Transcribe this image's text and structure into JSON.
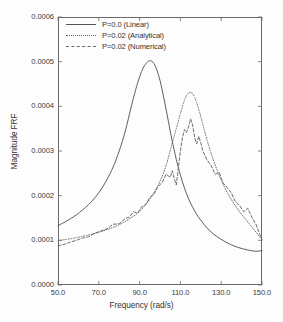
{
  "figure": {
    "background": "#fdfdfd",
    "frame_color": "#6a6a6a"
  },
  "axes": {
    "x_title": "Frequency (rad/s)",
    "y_title": "Magnitude FRF",
    "x_ticks": [
      "50.0",
      "70.0",
      "90.0",
      "110.0",
      "130.0",
      "150.0"
    ],
    "y_ticks": [
      "0.0000",
      "0.0001",
      "0.0002",
      "0.0003",
      "0.0004",
      "0.0005",
      "0.0006"
    ]
  },
  "legend": {
    "entries": [
      {
        "label": "P=0.0 (Linear)",
        "style": "solid",
        "color": "#555555"
      },
      {
        "label": "P=0.02 (Analytical)",
        "style": "dotted",
        "color": "#666666"
      },
      {
        "label": "P=0.02 (Numerical)",
        "style": "dashed",
        "color": "#666666"
      }
    ]
  },
  "chart_data": {
    "type": "line",
    "title": "",
    "xlabel": "Frequency (rad/s)",
    "ylabel": "Magnitude FRF",
    "xlim": [
      50.0,
      150.0
    ],
    "ylim": [
      0.0,
      0.0006
    ],
    "xticks": [
      50.0,
      70.0,
      90.0,
      110.0,
      130.0,
      150.0
    ],
    "yticks": [
      0.0,
      0.0001,
      0.0002,
      0.0003,
      0.0004,
      0.0005,
      0.0006
    ],
    "grid": false,
    "legend_position": "top-left",
    "series": [
      {
        "name": "P=0.0 (Linear)",
        "style": "solid",
        "color": "#555555",
        "peak_x": 100.0,
        "peak_y": 0.000502,
        "x": [
          50,
          53,
          56,
          59,
          62,
          65,
          68,
          71,
          74,
          77,
          80,
          83,
          86,
          88,
          90,
          92,
          94,
          95,
          96,
          97,
          98,
          99,
          100,
          101,
          102,
          103,
          104,
          105,
          106,
          108,
          110,
          112,
          114,
          116,
          118,
          120,
          123,
          126,
          129,
          132,
          135,
          138,
          141,
          144,
          147,
          150
        ],
        "y": [
          0.000133,
          0.00014,
          0.000148,
          0.000157,
          0.000168,
          0.00018,
          0.000195,
          0.000213,
          0.000236,
          0.000264,
          0.0003,
          0.000345,
          0.000401,
          0.000436,
          0.000466,
          0.000488,
          0.0005,
          0.000502,
          0.000501,
          0.000496,
          0.000487,
          0.000474,
          0.000458,
          0.000438,
          0.000416,
          0.000393,
          0.000369,
          0.000345,
          0.000322,
          0.000281,
          0.000246,
          0.000217,
          0.000193,
          0.000174,
          0.000158,
          0.000145,
          0.000128,
          0.000115,
          0.000105,
          9.66e-05,
          8.98e-05,
          8.45e-05,
          8.05e-05,
          7.75e-05,
          7.55e-05,
          7.7e-05
        ]
      },
      {
        "name": "P=0.02 (Analytical)",
        "style": "dotted",
        "color": "#666666",
        "peak_x": 115.0,
        "peak_y": 0.000431,
        "x": [
          50,
          54,
          58,
          62,
          66,
          70,
          74,
          78,
          82,
          86,
          90,
          94,
          97,
          100,
          103,
          106,
          108,
          110,
          112,
          113,
          114,
          115,
          116,
          117,
          118,
          119,
          120,
          122,
          124,
          126,
          128,
          130,
          133,
          136,
          139,
          142,
          145,
          148,
          150
        ],
        "y": [
          9.95e-05,
          0.000102,
          0.000105,
          0.000109,
          0.000113,
          0.000118,
          0.000124,
          0.000131,
          0.00014,
          0.000151,
          0.000165,
          0.000186,
          0.000206,
          0.000232,
          0.000268,
          0.000318,
          0.00035,
          0.000384,
          0.000414,
          0.000424,
          0.00043,
          0.000431,
          0.000428,
          0.00042,
          0.000408,
          0.000393,
          0.000377,
          0.000342,
          0.00031,
          0.000282,
          0.000257,
          0.000235,
          0.000207,
          0.000184,
          0.000164,
          0.000147,
          0.00013,
          0.000113,
          0.000101
        ]
      },
      {
        "name": "P=0.02 (Numerical)",
        "style": "dashed",
        "color": "#666666",
        "peak_x": 115.5,
        "peak_y": 0.000372,
        "noisy": true,
        "x": [
          50,
          53,
          56,
          59,
          62,
          65,
          68,
          71,
          74,
          77,
          80,
          83,
          85,
          87,
          89,
          91,
          93,
          95,
          97,
          99,
          101,
          103,
          105,
          106,
          107,
          108,
          109,
          110,
          111,
          112,
          113,
          114,
          115,
          116,
          117,
          118,
          119,
          120,
          121,
          123,
          125,
          127,
          129,
          131,
          133,
          135,
          137,
          139,
          141,
          143,
          145,
          147,
          150
        ],
        "y": [
          8.8e-05,
          9.1e-05,
          9.6e-05,
          0.0001,
          0.000105,
          0.000108,
          0.000116,
          0.000121,
          0.000126,
          0.000136,
          0.000137,
          0.000149,
          0.000152,
          0.000164,
          0.000161,
          0.000175,
          0.00018,
          0.000196,
          0.000203,
          0.00022,
          0.000229,
          0.000248,
          0.000241,
          0.000256,
          0.000238,
          0.000224,
          0.000262,
          0.0003,
          0.00033,
          0.000348,
          0.000341,
          0.000354,
          0.000372,
          0.000358,
          0.00033,
          0.000316,
          0.000333,
          0.000318,
          0.0003,
          0.00028,
          0.000268,
          0.000248,
          0.000252,
          0.000228,
          0.000218,
          0.000206,
          0.000186,
          0.000178,
          0.000164,
          0.000172,
          0.000152,
          0.000136,
          0.000101
        ]
      }
    ]
  }
}
